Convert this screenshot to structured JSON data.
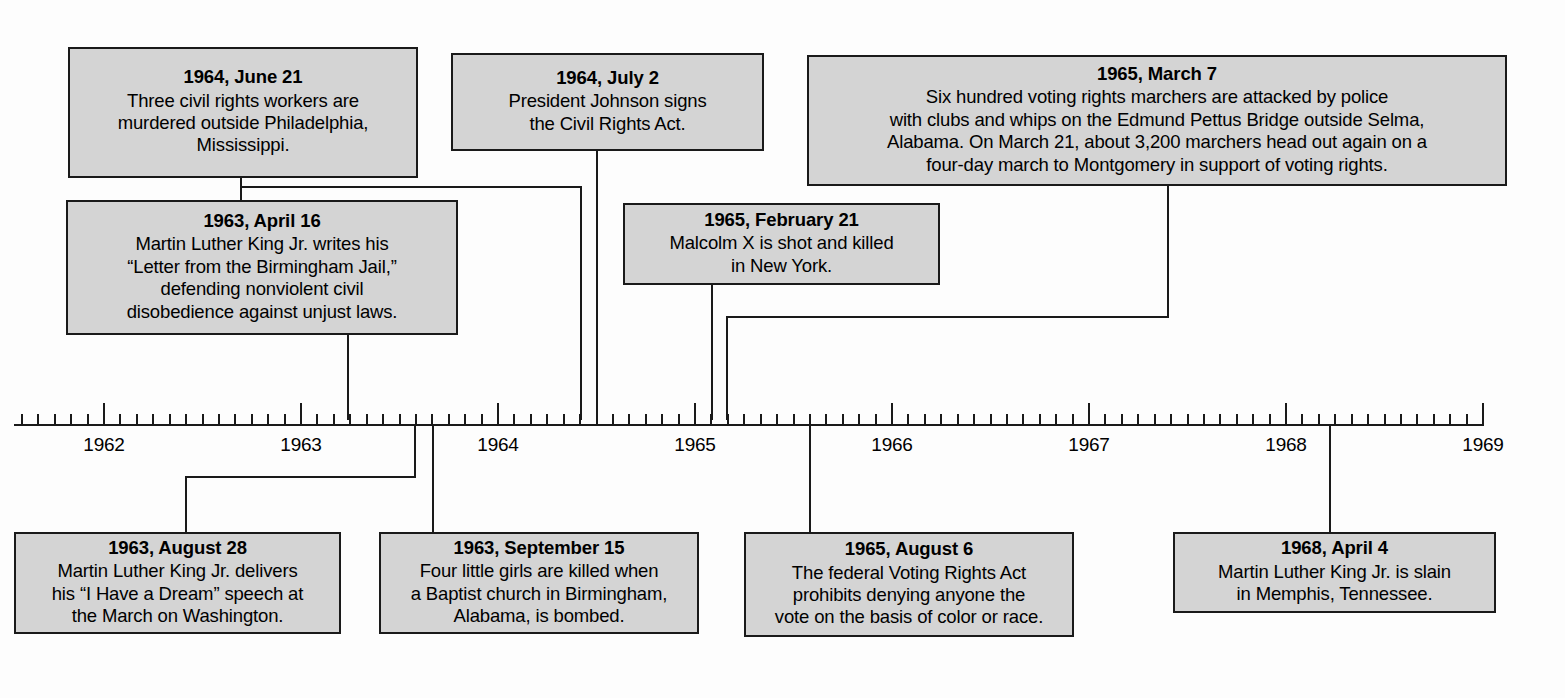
{
  "chart_data": {
    "type": "timeline",
    "axis": {
      "start_year": 1962,
      "end_year": 1969,
      "tick_interval": "month",
      "year_tick_labels": [
        "1962",
        "1963",
        "1964",
        "1965",
        "1966",
        "1967",
        "1968",
        "1969"
      ],
      "grid": false
    },
    "events": [
      {
        "date": "1964, June 21",
        "text": "Three civil rights workers are murdered outside Philadelphia, Mississippi.",
        "side": "above"
      },
      {
        "date": "1963, April 16",
        "text": "Martin Luther King Jr. writes his “Letter from the Birmingham Jail,” defending nonviolent civil disobedience against unjust laws.",
        "side": "above"
      },
      {
        "date": "1964, July 2",
        "text": "President Johnson signs the Civil Rights Act.",
        "side": "above"
      },
      {
        "date": "1965, February 21",
        "text": "Malcolm X is shot and killed in New York.",
        "side": "above"
      },
      {
        "date": "1965, March 7",
        "text": "Six hundred voting rights marchers are attacked by police with clubs and whips on the Edmund Pettus Bridge outside Selma, Alabama. On March 21, about 3,200 marchers head out again on a four-day march to Montgomery in support of voting rights.",
        "side": "above"
      },
      {
        "date": "1963, August 28",
        "text": "Martin Luther King Jr. delivers his “I Have a Dream” speech at the March on Washington.",
        "side": "below"
      },
      {
        "date": "1963, September 15",
        "text": "Four little girls are killed when a Baptist church in Birmingham, Alabama, is bombed.",
        "side": "below"
      },
      {
        "date": "1965, August 6",
        "text": "The federal Voting Rights Act prohibits denying anyone the vote on the basis of color or race.",
        "side": "below"
      },
      {
        "date": "1968, April 4",
        "text": "Martin Luther King Jr. is slain in Memphis, Tennessee.",
        "side": "below"
      }
    ]
  },
  "colors": {
    "box_fill": "#d4d4d4",
    "box_border": "#1a1a1a",
    "line": "#1a1a1a",
    "page_background": "#fdfdfd"
  },
  "boxes": {
    "june21_1964": {
      "date": "1964, June 21",
      "text": "Three civil rights workers are\nmurdered outside Philadelphia,\nMississippi."
    },
    "april16_1963": {
      "date": "1963, April 16",
      "text": "Martin Luther King Jr. writes his\n“Letter from the Birmingham Jail,”\ndefending nonviolent civil\ndisobedience against unjust laws."
    },
    "july2_1964": {
      "date": "1964, July 2",
      "text": "President Johnson signs\nthe Civil Rights Act."
    },
    "feb21_1965": {
      "date": "1965, February 21",
      "text": "Malcolm X is shot and killed\nin New York."
    },
    "march7_1965": {
      "date": "1965, March 7",
      "text": "Six hundred voting rights marchers are attacked by police\nwith clubs and whips on the Edmund Pettus Bridge outside Selma,\nAlabama. On March 21, about 3,200 marchers head out again on a\nfour-day march to Montgomery in support of voting rights."
    },
    "aug28_1963": {
      "date": "1963, August 28",
      "text": "Martin Luther King Jr. delivers\nhis “I Have a Dream” speech at\nthe March on Washington."
    },
    "sept15_1963": {
      "date": "1963, September 15",
      "text": "Four little girls are killed when\na Baptist church in Birmingham,\nAlabama, is bombed."
    },
    "aug6_1965": {
      "date": "1965, August 6",
      "text": "The federal Voting Rights Act\nprohibits denying anyone the\nvote on the basis of color or race."
    },
    "april4_1968": {
      "date": "1968, April 4",
      "text": "Martin Luther King Jr. is slain\nin Memphis, Tennessee."
    }
  },
  "axis_labels": {
    "y1962": "1962",
    "y1963": "1963",
    "y1964": "1964",
    "y1965": "1965",
    "y1966": "1966",
    "y1967": "1967",
    "y1968": "1968",
    "y1969": "1969"
  }
}
